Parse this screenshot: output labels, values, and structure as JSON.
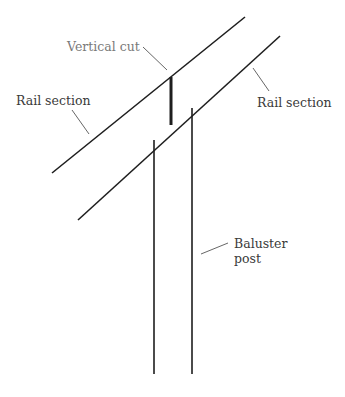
{
  "diagram": {
    "labels": {
      "vertical_cut": "Vertical cut",
      "rail_left": "Rail section",
      "rail_right": "Rail section",
      "baluster_line1": "Baluster",
      "baluster_line2": "post"
    },
    "colors": {
      "line": "#1e1e1e",
      "label": "#3a3a3a",
      "label_muted": "#7a7a7a",
      "background": "#ffffff"
    }
  }
}
